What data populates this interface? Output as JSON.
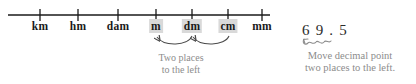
{
  "diagram": {
    "colors": {
      "line": "#1a1a1a",
      "label_text": "#1a1a1a",
      "highlight_bg": "#d9d9d9",
      "annotation_gray": "#8c8c8c",
      "number_text": "#2b2b2b",
      "background": "#ffffff"
    }
  },
  "numberline": {
    "axis_start_x": 8,
    "axis_end_x": 270,
    "axis_y": 15,
    "ticks": [
      {
        "x": 40,
        "label": "km",
        "highlighted": false
      },
      {
        "x": 78,
        "label": "hm",
        "highlighted": false
      },
      {
        "x": 118,
        "label": "dam",
        "highlighted": false
      },
      {
        "x": 156,
        "label": "m",
        "highlighted": true
      },
      {
        "x": 192,
        "label": "dm",
        "highlighted": true
      },
      {
        "x": 228,
        "label": "cm",
        "highlighted": true
      },
      {
        "x": 262,
        "label": "mm",
        "highlighted": false
      }
    ]
  },
  "arrows": {
    "count": 2,
    "direction": "left",
    "description": "two curved arrows pointing left from cm to dm and dm to m"
  },
  "left_caption": {
    "lines": [
      "Two places",
      "to the left"
    ]
  },
  "decimal": {
    "value": "6 9 . 5",
    "plain_value": "69.5",
    "squiggle": "decimal-shift-squiggle"
  },
  "right_caption": {
    "lines": [
      "Move decimal point",
      "two places to the left."
    ]
  }
}
